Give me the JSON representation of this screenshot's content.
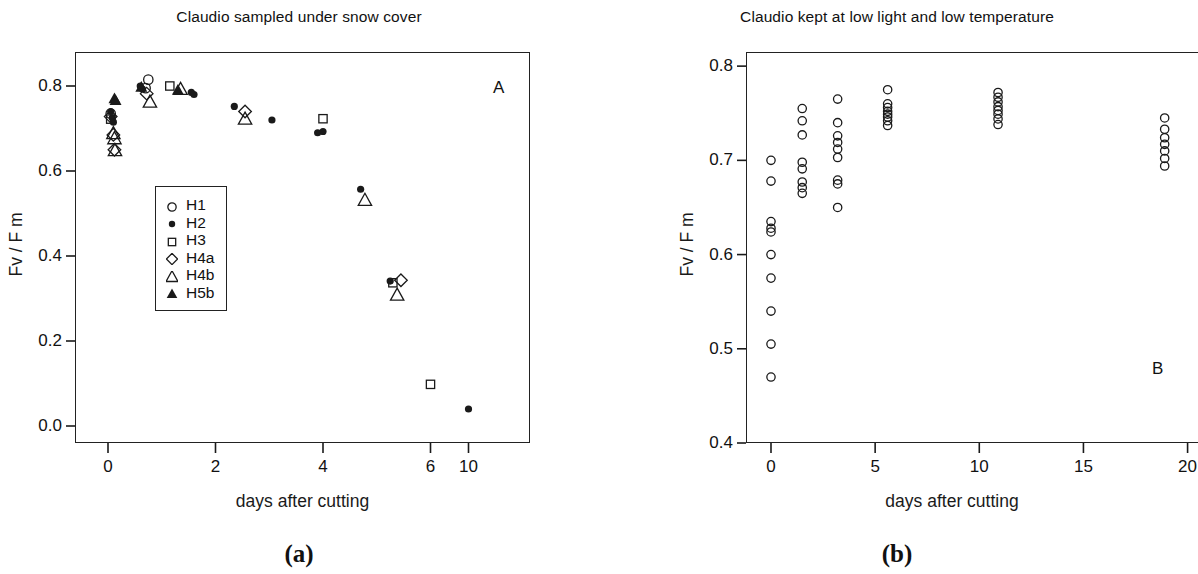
{
  "figure": {
    "caption_a": "(a)",
    "caption_b": "(b)"
  },
  "panel_a": {
    "panel_letter": "A",
    "legend_title": "",
    "legend": [
      {
        "label": "H1",
        "marker": "open-circle"
      },
      {
        "label": "H2",
        "marker": "filled-circle"
      },
      {
        "label": "H3",
        "marker": "open-square"
      },
      {
        "label": "H4a",
        "marker": "open-diamond"
      },
      {
        "label": "H4b",
        "marker": "open-triangle"
      },
      {
        "label": "H5b",
        "marker": "filled-triangle"
      }
    ]
  },
  "panel_b": {
    "panel_letter": "B"
  },
  "chart_data": [
    {
      "type": "scatter",
      "title": "Claudio sampled under snow cover",
      "xlabel": "days after cutting",
      "ylabel": "Fv / F m",
      "panel_label": "A",
      "grid": false,
      "legend_position": "inside-lower-left",
      "ylim": [
        -0.04,
        0.88
      ],
      "yticks": [
        0.0,
        0.2,
        0.4,
        0.6,
        0.8
      ],
      "ytick_labels": [
        "0.0",
        "0.2",
        "0.4",
        "0.6",
        "0.8"
      ],
      "xticks": [
        0,
        2,
        4,
        6,
        10
      ],
      "xtick_labels": [
        "0",
        "2",
        "4",
        "6",
        "10"
      ],
      "x_scale_note": "non-linear: 0-6 evenly spaced, 10 compressed just beyond 6",
      "series": [
        {
          "name": "H1",
          "marker": "open-circle",
          "points": [
            {
              "x": 0.05,
              "y": 0.735
            },
            {
              "x": 0.75,
              "y": 0.815
            },
            {
              "x": 0.7,
              "y": 0.795
            }
          ]
        },
        {
          "name": "H2",
          "marker": "filled-circle",
          "points": [
            {
              "x": 0.05,
              "y": 0.74
            },
            {
              "x": 0.08,
              "y": 0.725
            },
            {
              "x": 0.1,
              "y": 0.715
            },
            {
              "x": 0.6,
              "y": 0.8
            },
            {
              "x": 0.64,
              "y": 0.793
            },
            {
              "x": 1.55,
              "y": 0.785
            },
            {
              "x": 1.6,
              "y": 0.78
            },
            {
              "x": 2.35,
              "y": 0.752
            },
            {
              "x": 3.05,
              "y": 0.72
            },
            {
              "x": 3.9,
              "y": 0.69
            },
            {
              "x": 4.0,
              "y": 0.693
            },
            {
              "x": 4.7,
              "y": 0.557
            },
            {
              "x": 5.25,
              "y": 0.341
            },
            {
              "x": 10.0,
              "y": 0.04
            }
          ]
        },
        {
          "name": "H3",
          "marker": "open-square",
          "points": [
            {
              "x": 0.05,
              "y": 0.722
            },
            {
              "x": 1.15,
              "y": 0.8
            },
            {
              "x": 4.0,
              "y": 0.723
            },
            {
              "x": 5.3,
              "y": 0.337
            },
            {
              "x": 6.0,
              "y": 0.098
            }
          ]
        },
        {
          "name": "H4a",
          "marker": "open-diamond",
          "points": [
            {
              "x": 0.05,
              "y": 0.728
            },
            {
              "x": 0.1,
              "y": 0.685
            },
            {
              "x": 0.12,
              "y": 0.65
            },
            {
              "x": 0.72,
              "y": 0.782
            },
            {
              "x": 2.55,
              "y": 0.74
            },
            {
              "x": 5.45,
              "y": 0.343
            }
          ]
        },
        {
          "name": "H4b",
          "marker": "open-triangle",
          "points": [
            {
              "x": 0.1,
              "y": 0.688
            },
            {
              "x": 0.12,
              "y": 0.676
            },
            {
              "x": 0.13,
              "y": 0.648
            },
            {
              "x": 0.78,
              "y": 0.762
            },
            {
              "x": 1.35,
              "y": 0.792
            },
            {
              "x": 2.55,
              "y": 0.722
            },
            {
              "x": 4.78,
              "y": 0.531
            },
            {
              "x": 5.38,
              "y": 0.308
            }
          ]
        },
        {
          "name": "H5b",
          "marker": "filled-triangle",
          "points": [
            {
              "x": 0.12,
              "y": 0.77
            },
            {
              "x": 0.14,
              "y": 0.766
            },
            {
              "x": 0.62,
              "y": 0.797
            },
            {
              "x": 1.3,
              "y": 0.79
            }
          ]
        }
      ]
    },
    {
      "type": "scatter",
      "title": "Claudio kept at low light and low temperature",
      "xlabel": "days  after cutting",
      "ylabel": "Fv / F m",
      "panel_label": "B",
      "grid": false,
      "legend_position": "none",
      "ylim": [
        0.4,
        0.815
      ],
      "yticks": [
        0.4,
        0.5,
        0.6,
        0.7,
        0.8
      ],
      "ytick_labels": [
        "0.4",
        "0.5",
        "0.6",
        "0.7",
        "0.8"
      ],
      "xlim": [
        -1.2,
        20.5
      ],
      "xticks": [
        0,
        5,
        10,
        15,
        20
      ],
      "xtick_labels": [
        "0",
        "5",
        "10",
        "15",
        "20"
      ],
      "series": [
        {
          "name": "measurements",
          "marker": "open-circle",
          "points": [
            {
              "x": 0.0,
              "y": 0.7
            },
            {
              "x": 0.0,
              "y": 0.678
            },
            {
              "x": 0.0,
              "y": 0.635
            },
            {
              "x": 0.0,
              "y": 0.628
            },
            {
              "x": 0.0,
              "y": 0.624
            },
            {
              "x": 0.0,
              "y": 0.6
            },
            {
              "x": 0.0,
              "y": 0.575
            },
            {
              "x": 0.0,
              "y": 0.54
            },
            {
              "x": 0.0,
              "y": 0.505
            },
            {
              "x": 0.0,
              "y": 0.47
            },
            {
              "x": 1.5,
              "y": 0.755
            },
            {
              "x": 1.5,
              "y": 0.742
            },
            {
              "x": 1.5,
              "y": 0.727
            },
            {
              "x": 1.5,
              "y": 0.698
            },
            {
              "x": 1.5,
              "y": 0.691
            },
            {
              "x": 1.5,
              "y": 0.677
            },
            {
              "x": 1.5,
              "y": 0.671
            },
            {
              "x": 1.5,
              "y": 0.665
            },
            {
              "x": 3.2,
              "y": 0.765
            },
            {
              "x": 3.2,
              "y": 0.74
            },
            {
              "x": 3.2,
              "y": 0.726
            },
            {
              "x": 3.2,
              "y": 0.719
            },
            {
              "x": 3.2,
              "y": 0.712
            },
            {
              "x": 3.2,
              "y": 0.703
            },
            {
              "x": 3.2,
              "y": 0.679
            },
            {
              "x": 3.2,
              "y": 0.675
            },
            {
              "x": 3.2,
              "y": 0.65
            },
            {
              "x": 5.6,
              "y": 0.775
            },
            {
              "x": 5.6,
              "y": 0.76
            },
            {
              "x": 5.6,
              "y": 0.756
            },
            {
              "x": 5.6,
              "y": 0.752
            },
            {
              "x": 5.6,
              "y": 0.749
            },
            {
              "x": 5.6,
              "y": 0.746
            },
            {
              "x": 5.6,
              "y": 0.742
            },
            {
              "x": 5.6,
              "y": 0.737
            },
            {
              "x": 10.9,
              "y": 0.772
            },
            {
              "x": 10.9,
              "y": 0.767
            },
            {
              "x": 10.9,
              "y": 0.762
            },
            {
              "x": 10.9,
              "y": 0.757
            },
            {
              "x": 10.9,
              "y": 0.753
            },
            {
              "x": 10.9,
              "y": 0.749
            },
            {
              "x": 10.9,
              "y": 0.744
            },
            {
              "x": 10.9,
              "y": 0.738
            },
            {
              "x": 18.9,
              "y": 0.745
            },
            {
              "x": 18.9,
              "y": 0.733
            },
            {
              "x": 18.9,
              "y": 0.724
            },
            {
              "x": 18.9,
              "y": 0.717
            },
            {
              "x": 18.9,
              "y": 0.71
            },
            {
              "x": 18.9,
              "y": 0.702
            },
            {
              "x": 18.9,
              "y": 0.694
            }
          ]
        }
      ]
    }
  ]
}
